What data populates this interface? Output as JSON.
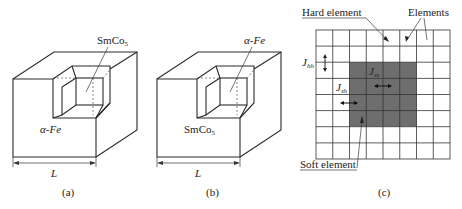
{
  "panels": [
    {
      "id": "a",
      "caption": "(a)",
      "inner_label_main": "SmCo",
      "inner_label_sub": "5",
      "outer_label": "α-Fe",
      "dimension_label": "L"
    },
    {
      "id": "b",
      "caption": "(b)",
      "inner_label": "α-Fe",
      "outer_label_main": "SmCo",
      "outer_label_sub": "5",
      "dimension_label": "L"
    },
    {
      "id": "c",
      "caption": "(c)",
      "hard_element_label": "Hard element",
      "elements_label": "Elements",
      "soft_element_label": "Soft element",
      "j_hh": {
        "main": "J",
        "sub": "hh"
      },
      "j_ss": {
        "main": "J",
        "sub": "ss"
      },
      "j_sh": {
        "main": "J",
        "sub": "sh"
      },
      "grid": {
        "cols": 8,
        "rows": 8,
        "soft_block": {
          "col_start": 2,
          "col_end": 5,
          "row_start": 2,
          "row_end": 5
        }
      },
      "soft_color": "#6e6e6e"
    }
  ]
}
